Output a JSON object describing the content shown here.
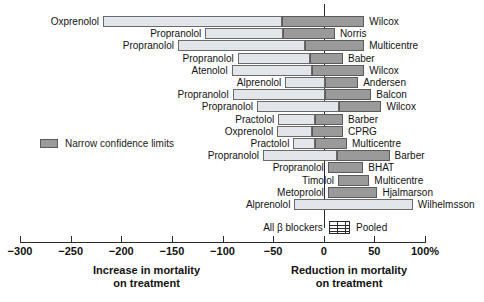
{
  "chart_data": {
    "type": "bar",
    "orientation": "horizontal",
    "title": "",
    "xlabel": "",
    "ylabel": "",
    "xlim": [
      -300,
      100
    ],
    "xticks": [
      -300,
      -250,
      -200,
      -150,
      -100,
      -50,
      0,
      50,
      100
    ],
    "xticklabels": [
      "−300",
      "−250",
      "−200",
      "−150",
      "−100",
      "−50",
      "0",
      "50",
      "100%"
    ],
    "grid": false,
    "zero_reference_line": 0,
    "legend": {
      "position": "left-middle",
      "entries": [
        {
          "label": "Narrow confidence limits",
          "color": "#9a9a9a"
        }
      ]
    },
    "axis_captions": {
      "left": "Increase in mortality\non treatment",
      "left_line1": "Increase in mortality",
      "left_line2": "on treatment",
      "right": "Reduction in mortality\non treatment",
      "right_line1": "Reduction in mortality",
      "right_line2": "on treatment"
    },
    "colors": {
      "wide_ci": "#e2e6ea",
      "narrow_ci": "#9a9a9a",
      "outline": "#5a5a5a",
      "axis": "#2b2b2b"
    },
    "series_description": "Confidence interval bars: light segment = wide confidence limits, dark segment = narrow confidence limits",
    "rows": [
      {
        "drug": "Oxprenolol",
        "study": "Wilcox",
        "wide_low": -218,
        "wide_high": -41,
        "narrow_low": -41,
        "narrow_high": 40
      },
      {
        "drug": "Propranolol",
        "study": "Norris",
        "wide_low": -117,
        "wide_high": -40,
        "narrow_low": -40,
        "narrow_high": 11
      },
      {
        "drug": "Propranolol",
        "study": "Multicentre",
        "wide_low": -144,
        "wide_high": -19,
        "narrow_low": -19,
        "narrow_high": 40
      },
      {
        "drug": "Propranolol",
        "study": "Baber",
        "wide_low": -85,
        "wide_high": -14,
        "narrow_low": -14,
        "narrow_high": 19
      },
      {
        "drug": "Atenolol",
        "study": "Wilcox",
        "wide_low": -91,
        "wide_high": -12,
        "narrow_low": -12,
        "narrow_high": 40
      },
      {
        "drug": "Alprenolol",
        "study": "Andersen",
        "wide_low": -38,
        "wide_high": 1,
        "narrow_low": 1,
        "narrow_high": 34
      },
      {
        "drug": "Propranolol",
        "study": "Balcon",
        "wide_low": -90,
        "wide_high": 1,
        "narrow_low": 1,
        "narrow_high": 47
      },
      {
        "drug": "Propranolol",
        "study": "Wilcox",
        "wide_low": -66,
        "wide_high": 15,
        "narrow_low": 15,
        "narrow_high": 57
      },
      {
        "drug": "Practolol",
        "study": "Barber",
        "wide_low": -45,
        "wide_high": -9,
        "narrow_low": -9,
        "narrow_high": 19
      },
      {
        "drug": "Oxprenolol",
        "study": "CPRG",
        "wide_low": -46,
        "wide_high": -12,
        "narrow_low": -12,
        "narrow_high": 19
      },
      {
        "drug": "Practolol",
        "study": "Multicentre",
        "wide_low": -30,
        "wide_high": -9,
        "narrow_low": -9,
        "narrow_high": 23
      },
      {
        "drug": "Propranolol",
        "study": "Barber",
        "wide_low": -60,
        "wide_high": 13,
        "narrow_low": 13,
        "narrow_high": 65
      },
      {
        "drug": "Propranolol",
        "study": "BHAT",
        "wide_low": null,
        "wide_high": null,
        "narrow_low": 4,
        "narrow_high": 39
      },
      {
        "drug": "Timolol",
        "study": "Multicentre",
        "wide_low": null,
        "wide_high": null,
        "narrow_low": 14,
        "narrow_high": 45
      },
      {
        "drug": "Metoprolol",
        "study": "Hjalmarson",
        "wide_low": null,
        "wide_high": null,
        "narrow_low": 4,
        "narrow_high": 53
      },
      {
        "drug": "Alprenolol",
        "study": "Wilhelmsson",
        "wide_low": -29,
        "wide_high": 88,
        "narrow_low": null,
        "narrow_high": null
      }
    ],
    "pooled": {
      "drug": "All β blockers",
      "study": "Pooled",
      "low": 5,
      "high": 26,
      "style": "hatched-box"
    }
  }
}
